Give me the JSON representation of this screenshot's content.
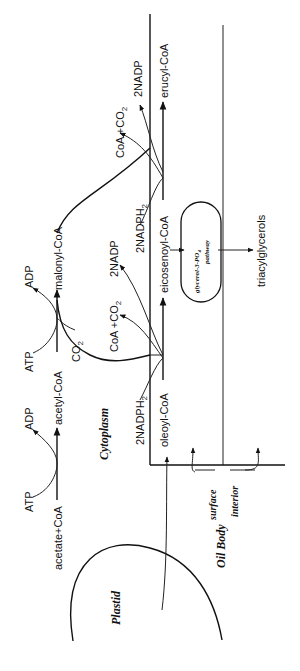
{
  "diagram": {
    "orientation": "rotated 90deg counter-clockwise",
    "compartments": {
      "plastid": "Plastid",
      "cytoplasm": "Cytoplasm",
      "oil_body": "Oil Body",
      "oil_body_surface": "surface",
      "oil_body_interior": "interior"
    },
    "plastid_step": {
      "substrate": "acetate+CoA",
      "cofactor_in": "ATP",
      "cofactor_out": "ADP"
    },
    "acetyl_step": {
      "product": "acetyl-CoA",
      "cofactor_in": "ATP",
      "cofactor_out": "ADP",
      "co2_in": "CO2",
      "co2_label_main": "CO",
      "co2_sub": "2"
    },
    "malonyl": "malonyl-CoA",
    "elongation_1": {
      "substrate": "oleoyl-CoA",
      "reductant_in": "2NADPH",
      "reductant_in_main": "2NADPH",
      "reductant_in_sub": "2",
      "release_1_main": "CoA +CO",
      "release_1_sub": "2",
      "release_2": "2NADP",
      "product": "eicosenoyl-CoA"
    },
    "elongation_2": {
      "reductant_in_main": "2NADPH",
      "reductant_in_sub": "2",
      "release_1_main": "CoA +CO",
      "release_1_sub": "2",
      "release_2": "2NADP",
      "product": "erucyl-CoA"
    },
    "glycerol_pathway": {
      "line1_main": "glycerol-3-PO",
      "line1_sub": "4",
      "line2": "pathway"
    },
    "end_product": "triacylglycerols",
    "colors": {
      "ink": "#111111",
      "background": "#ffffff"
    }
  }
}
